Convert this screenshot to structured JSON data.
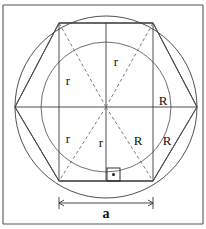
{
  "figure": {
    "geometry": {
      "center_x": 106,
      "center_y": 107,
      "outer_radius_R": 91,
      "inner_radius_r": 65,
      "square_half_side": 47,
      "square_side_a": 94,
      "square_left": 59,
      "square_right": 153,
      "square_top": 23,
      "square_bottom": 181
    },
    "labels": {
      "r_top": "r",
      "r_left_upper": "r",
      "r_left_lower": "r",
      "r_bottom_center": "r",
      "R_right": "R",
      "R_lower_inner": "R",
      "R_lower_outer": "R",
      "a_dimension": "a"
    },
    "label_positions": {
      "r_top": {
        "x": 116,
        "y": 63
      },
      "r_left_upper": {
        "x": 68,
        "y": 82
      },
      "r_left_lower": {
        "x": 68,
        "y": 140
      },
      "r_bottom_center": {
        "x": 101,
        "y": 144
      },
      "R_right": {
        "x": 163,
        "y": 102
      },
      "R_lower_inner": {
        "x": 138,
        "y": 142
      },
      "R_lower_outer": {
        "x": 167,
        "y": 142
      },
      "a_dimension": {
        "x": 106,
        "y": 215
      }
    },
    "marker": {
      "right_angle_label": "right-angle-marker",
      "x": 107,
      "y": 168,
      "size": 13
    },
    "dimension": {
      "y": 203,
      "from_x": 59,
      "to_x": 153,
      "arrow_size": 4
    },
    "colors": {
      "stroke": "#3c3c3c",
      "dashed": "#6b6b6b",
      "frame": "#555555",
      "text": "#111111",
      "background": "#ffffff"
    },
    "frame": {
      "top_y": 5,
      "bottom_y": 224,
      "left_x": 3,
      "right_x": 203
    }
  }
}
